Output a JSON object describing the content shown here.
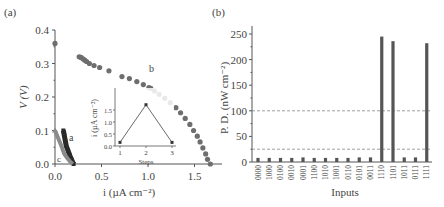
{
  "panels": {
    "a": {
      "label": "(a)"
    },
    "b": {
      "label": "(b)"
    }
  },
  "chart_data": [
    {
      "type": "scatter",
      "panel": "(a)",
      "title": "",
      "xlabel": "i (µA cm⁻²)",
      "ylabel": "V (V)",
      "xlim": [
        0,
        1.7
      ],
      "ylim": [
        0,
        0.4
      ],
      "xticks": [
        "0.0",
        "0.5",
        "1.0",
        "1.5"
      ],
      "yticks": [
        "0.0",
        "0.1",
        "0.2",
        "0.3",
        "0.4"
      ],
      "grid": false,
      "series": [
        {
          "name": "b",
          "label": "b",
          "marker": "circle",
          "color": "#6e6e6e",
          "points": [
            [
              0.0,
              0.36
            ],
            [
              0.26,
              0.32
            ],
            [
              0.28,
              0.318
            ],
            [
              0.3,
              0.314
            ],
            [
              0.32,
              0.31
            ],
            [
              0.34,
              0.306
            ],
            [
              0.37,
              0.3
            ],
            [
              0.42,
              0.294
            ],
            [
              0.48,
              0.288
            ],
            [
              0.58,
              0.278
            ],
            [
              0.72,
              0.261
            ],
            [
              0.8,
              0.255
            ],
            [
              0.88,
              0.246
            ],
            [
              0.95,
              0.237
            ],
            [
              1.01,
              0.228
            ],
            [
              1.03,
              0.226
            ],
            [
              1.07,
              0.218
            ],
            [
              1.12,
              0.208
            ],
            [
              1.18,
              0.196
            ],
            [
              1.24,
              0.183
            ],
            [
              1.3,
              0.168
            ],
            [
              1.35,
              0.153
            ],
            [
              1.4,
              0.136
            ],
            [
              1.45,
              0.118
            ],
            [
              1.49,
              0.1
            ],
            [
              1.53,
              0.083
            ],
            [
              1.56,
              0.066
            ],
            [
              1.59,
              0.048
            ],
            [
              1.62,
              0.03
            ],
            [
              1.64,
              0.014
            ],
            [
              1.67,
              0.0
            ]
          ]
        },
        {
          "name": "a",
          "label": "a",
          "marker": "square",
          "color": "#2a2a2a",
          "points": [
            [
              0.09,
              0.1
            ],
            [
              0.1,
              0.085
            ],
            [
              0.11,
              0.07
            ],
            [
              0.12,
              0.055
            ],
            [
              0.14,
              0.04
            ],
            [
              0.16,
              0.025
            ],
            [
              0.18,
              0.012
            ],
            [
              0.2,
              0.0
            ]
          ]
        },
        {
          "name": "c",
          "label": "c",
          "marker": "triangle",
          "color": "#8a8a8a",
          "points": [
            [
              0.0,
              0.1
            ],
            [
              0.06,
              0.06
            ],
            [
              0.08,
              0.045
            ],
            [
              0.1,
              0.03
            ],
            [
              0.13,
              0.018
            ],
            [
              0.16,
              0.008
            ],
            [
              0.19,
              0.0
            ]
          ]
        }
      ],
      "inset": {
        "type": "line",
        "xlabel": "Steps",
        "ylabel": "i (µA cm⁻²)",
        "xticks": [
          "1",
          "2",
          "3"
        ],
        "yticks": [
          "0.0",
          "0.5",
          "1.0",
          "1.5"
        ],
        "x": [
          1,
          2,
          3
        ],
        "values": [
          0.15,
          1.72,
          0.15
        ],
        "xlim": [
          0.8,
          3.2
        ],
        "ylim": [
          0,
          1.9
        ]
      }
    },
    {
      "type": "bar",
      "panel": "(b)",
      "title": "",
      "xlabel": "Inputs",
      "ylabel": "P. D. (nW cm⁻²)",
      "ylim": [
        0,
        260
      ],
      "yticks": [
        "0",
        "50",
        "100",
        "150",
        "200",
        "250"
      ],
      "grid": false,
      "reference_lines": [
        {
          "y": 100,
          "style": "dashed"
        },
        {
          "y": 25,
          "style": "dashed"
        }
      ],
      "categories": [
        "0000",
        "1000",
        "0100",
        "0010",
        "0001",
        "1100",
        "1010",
        "1001",
        "0110",
        "0101",
        "0011",
        "1110",
        "1101",
        "1011",
        "0111",
        "1111"
      ],
      "values": [
        8,
        8,
        8,
        8,
        9,
        8,
        8,
        8,
        8,
        9,
        9,
        245,
        236,
        9,
        9,
        232
      ],
      "color": "#555555"
    }
  ]
}
